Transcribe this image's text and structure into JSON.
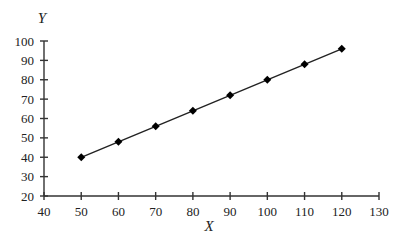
{
  "chart_data": {
    "type": "line",
    "title": "",
    "xlabel": "X",
    "ylabel": "Y",
    "xlim": [
      40,
      130
    ],
    "ylim": [
      20,
      100
    ],
    "x_ticks": [
      40,
      50,
      60,
      70,
      80,
      90,
      100,
      110,
      120,
      130
    ],
    "y_ticks": [
      20,
      30,
      40,
      50,
      60,
      70,
      80,
      90,
      100
    ],
    "grid": false,
    "legend": null,
    "marker": "diamond",
    "series": [
      {
        "name": "Y",
        "x": [
          50,
          60,
          70,
          80,
          90,
          100,
          110,
          120
        ],
        "values": [
          40,
          48,
          56,
          64,
          72,
          80,
          88,
          96
        ]
      }
    ]
  },
  "colors": {
    "line": "#222222",
    "marker": "#000000",
    "axis": "#333333",
    "background": "#ffffff"
  }
}
